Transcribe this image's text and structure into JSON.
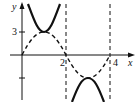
{
  "diagram": {
    "type": "function-graph",
    "axis_labels": {
      "x": "x",
      "y": "y"
    },
    "ticks": {
      "x": [
        "2",
        "4"
      ],
      "y": [
        "3"
      ]
    },
    "curves": [
      {
        "name": "sine",
        "style": "dashed",
        "description": "y = 3 sin(pi x / 2)"
      },
      {
        "name": "cosecant",
        "style": "solid",
        "description": "y = 3 csc(pi x / 2)"
      }
    ],
    "asymptotes": [
      "x = 2",
      "x = 4"
    ]
  }
}
